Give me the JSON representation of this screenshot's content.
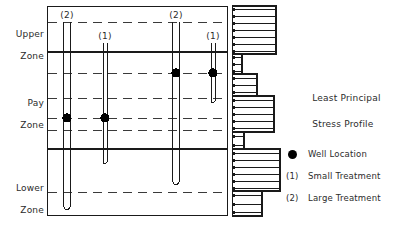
{
  "figure": {
    "title": "Least Principal Stress Profile",
    "title_line1": "Least Principal",
    "title_line2": "Stress Profile",
    "frame": {
      "x": 47,
      "y": 6,
      "width": 181,
      "height": 210
    },
    "colors": {
      "line": "#1a1a1a",
      "dashed": "#3a3a3a",
      "marker": "#000000",
      "background": "#ffffff"
    }
  },
  "zones": [
    {
      "id": "upper",
      "line1": "Upper",
      "line2": "Zone",
      "label": "Upper Zone",
      "label_y": 26,
      "top": 6,
      "bottom": 52
    },
    {
      "id": "pay",
      "line1": "Pay",
      "line2": "Zone",
      "label": "Pay Zone",
      "label_y": 95,
      "top": 52,
      "bottom": 149
    },
    {
      "id": "lower",
      "line1": "Lower",
      "line2": "Zone",
      "label": "Lower Zone",
      "label_y": 180,
      "top": 149,
      "bottom": 216
    }
  ],
  "zone_boundaries": [
    52,
    149
  ],
  "layer_lines": [
    22,
    73,
    98,
    118,
    130,
    192
  ],
  "wells": [
    {
      "id": "well-1",
      "tag": "(2)",
      "treatment": "Large Treatment",
      "x": 67,
      "tag_y": 10,
      "top": 22,
      "bottom": 210,
      "width": 7,
      "dot_y": 118
    },
    {
      "id": "well-2",
      "tag": "(1)",
      "treatment": "Small Treatment",
      "x": 105,
      "tag_y": 31,
      "top": 43,
      "bottom": 164,
      "width": 4,
      "dot_y": 118
    },
    {
      "id": "well-3",
      "tag": "(2)",
      "treatment": "Large Treatment",
      "x": 176,
      "tag_y": 10,
      "top": 22,
      "bottom": 185,
      "width": 7,
      "dot_y": 73
    },
    {
      "id": "well-4",
      "tag": "(1)",
      "treatment": "Small Treatment",
      "x": 213,
      "tag_y": 31,
      "top": 43,
      "bottom": 103,
      "width": 4,
      "dot_y": 73
    }
  ],
  "chart_data": {
    "type": "bar",
    "orientation": "horizontal",
    "title": "Least Principal Stress Profile",
    "xlabel": "",
    "ylabel": "",
    "grid": false,
    "legend_position": "bottom-right",
    "baseline_x": 232,
    "categories": [
      "8",
      "15",
      "22",
      "29",
      "36",
      "43",
      "50",
      "57",
      "63",
      "69",
      "77",
      "84",
      "91",
      "99",
      "106",
      "113",
      "120",
      "127",
      "136",
      "143",
      "152",
      "159",
      "166",
      "173",
      "180",
      "187",
      "194",
      "201",
      "208"
    ],
    "values": [
      44,
      44,
      44,
      44,
      44,
      44,
      44,
      10,
      10,
      10,
      25,
      25,
      25,
      42,
      42,
      42,
      42,
      42,
      12,
      12,
      48,
      48,
      48,
      48,
      48,
      48,
      30,
      30,
      30
    ],
    "segments": [
      {
        "name": "Upper Zone",
        "depth_top": 6,
        "depth_bottom": 54,
        "stress": 44,
        "bar_count": 7
      },
      {
        "name": "Pay Zone Upper",
        "depth_top": 54,
        "depth_bottom": 74,
        "stress": 10,
        "bar_count": 3
      },
      {
        "name": "Pay Zone Middle",
        "depth_top": 74,
        "depth_bottom": 96,
        "stress": 25,
        "bar_count": 3
      },
      {
        "name": "Pay Zone Lower",
        "depth_top": 96,
        "depth_bottom": 132,
        "stress": 42,
        "bar_count": 5
      },
      {
        "name": "Pay Zone Base",
        "depth_top": 132,
        "depth_bottom": 149,
        "stress": 12,
        "bar_count": 2
      },
      {
        "name": "Lower Zone Upper",
        "depth_top": 149,
        "depth_bottom": 191,
        "stress": 48,
        "bar_count": 6
      },
      {
        "name": "Lower Zone Base",
        "depth_top": 191,
        "depth_bottom": 216,
        "stress": 30,
        "bar_count": 3
      }
    ],
    "ylim": [
      6,
      216
    ],
    "xlim": [
      0,
      50
    ]
  },
  "legend": {
    "items": [
      {
        "key": "●",
        "key_type": "dot",
        "label": "Well Location"
      },
      {
        "key": "(1)",
        "key_type": "text",
        "label": "Small Treatment"
      },
      {
        "key": "(2)",
        "key_type": "text",
        "label": "Large Treatment"
      }
    ]
  }
}
